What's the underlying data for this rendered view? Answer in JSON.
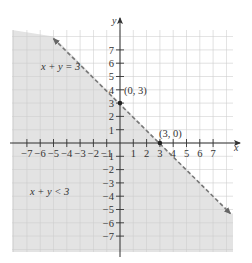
{
  "chart_data": {
    "type": "area",
    "title": "",
    "xlabel": "x",
    "ylabel": "y",
    "xlim": [
      -8,
      8
    ],
    "ylim": [
      -8,
      8
    ],
    "grid": true,
    "x_ticks": [
      -7,
      -6,
      -5,
      -4,
      -3,
      -2,
      -1,
      1,
      2,
      3,
      4,
      5,
      6,
      7
    ],
    "y_ticks": [
      -7,
      -6,
      -5,
      -4,
      -3,
      -2,
      -1,
      1,
      2,
      3,
      4,
      5,
      6,
      7
    ],
    "x_tick_labels": [
      "−7",
      "−6",
      "−5",
      "−4",
      "−3",
      "−2",
      "−1",
      "1",
      "2",
      "3",
      "4",
      "5",
      "6",
      "7"
    ],
    "y_tick_labels": [
      "−7",
      "−6",
      "−5",
      "−4",
      "−3",
      "−2",
      "−1",
      "1",
      "2",
      "3",
      "4",
      "5",
      "6",
      "7"
    ],
    "boundary_line": {
      "equation": "x + y = 3",
      "style": "dashed",
      "color": "#777777",
      "points": [
        [
          -5,
          8
        ],
        [
          8.3,
          -5.3
        ]
      ]
    },
    "shaded_region": {
      "inequality": "x + y < 3",
      "side": "below-left",
      "color": "#e3e3e3"
    },
    "points": [
      {
        "x": 0,
        "y": 3,
        "label": "(0, 3)"
      },
      {
        "x": 3,
        "y": 0,
        "label": "(3, 0)"
      }
    ],
    "annotations": [
      {
        "text": "x + y = 3",
        "x": -5.8,
        "y": 5.7
      },
      {
        "text": "x + y < 3",
        "x": -6.7,
        "y": -3.7
      }
    ]
  },
  "labels": {
    "x_axis": "x",
    "y_axis": "y",
    "line_eq": "x + y = 3",
    "region_ineq": "x + y < 3",
    "point_a": "(0, 3)",
    "point_b": "(3, 0)"
  },
  "colors": {
    "shade": "#e3e3e3",
    "grid_on_shade": "#cfcfcf",
    "grid_on_white": "#e6e6e6",
    "axis": "#333333",
    "dash_line": "#777777"
  }
}
